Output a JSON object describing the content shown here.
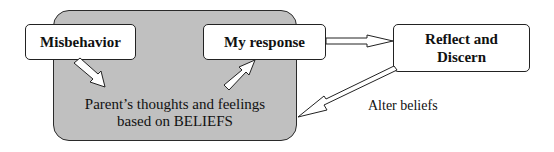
{
  "diagram": {
    "region": {
      "label_line1": "Parent’s thoughts and feelings",
      "label_line2": "based on BELIEFS",
      "fill_color": "#c9c9c9"
    },
    "nodes": [
      {
        "id": "misbehavior",
        "label": "Misbehavior"
      },
      {
        "id": "my-response",
        "label": "My response"
      },
      {
        "id": "reflect",
        "label_line1": "Reflect and",
        "label_line2": "Discern"
      }
    ],
    "edges": [
      {
        "from": "misbehavior",
        "to": "region",
        "label": ""
      },
      {
        "from": "region",
        "to": "my-response",
        "label": ""
      },
      {
        "from": "my-response",
        "to": "reflect",
        "label": ""
      },
      {
        "from": "reflect",
        "to": "region",
        "label": "Alter beliefs"
      }
    ]
  }
}
